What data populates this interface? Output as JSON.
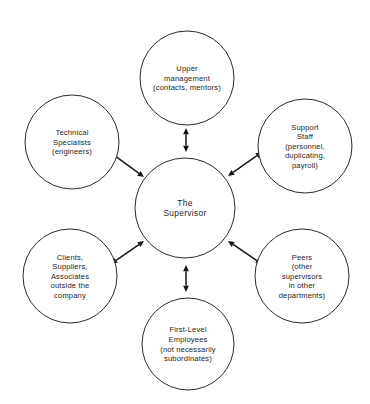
{
  "diagram": {
    "type": "hub-and-spoke",
    "colors": {
      "background": "#ffffff",
      "circle_stroke": "#2b2b2b",
      "text": "#1d1d1d",
      "arrow": "#161616"
    },
    "center": {
      "id": "the-supervisor",
      "lines": [
        "The",
        "Supervisor"
      ],
      "cx": 185,
      "cy": 208,
      "r": 50
    },
    "nodes": [
      {
        "id": "upper-management",
        "position": "top",
        "lines": [
          "Upper",
          "management",
          "(contacts,  mentors)"
        ],
        "cx": 187,
        "cy": 78,
        "r": 47
      },
      {
        "id": "support-staff",
        "position": "top-right",
        "lines": [
          "Support",
          "Staff",
          "(personnel,",
          "duplicating,",
          "payroll)"
        ],
        "cx": 305,
        "cy": 146,
        "r": 47
      },
      {
        "id": "peers",
        "position": "bottom-right",
        "lines": [
          "Peers",
          "(other",
          "supervisors",
          "in other",
          "departments)"
        ],
        "cx": 302,
        "cy": 276,
        "r": 47
      },
      {
        "id": "first-level-employees",
        "position": "bottom",
        "lines": [
          "First-Level",
          "Employees",
          "(not necessarily",
          "subordinates)"
        ],
        "cx": 188,
        "cy": 344,
        "r": 46
      },
      {
        "id": "clients-suppliers-associates",
        "position": "bottom-left",
        "lines": [
          "Clients,",
          "Suppliers,",
          "Associates",
          "outside the",
          "company"
        ],
        "cx": 70,
        "cy": 276,
        "r": 47
      },
      {
        "id": "technical-specialists",
        "position": "top-left",
        "lines": [
          "Technical",
          "Specialists",
          "(engineers)"
        ],
        "cx": 72,
        "cy": 142,
        "r": 47
      }
    ],
    "connectors": [
      {
        "id": "supervisor-upper-management",
        "from": "the-supervisor",
        "to": "upper-management",
        "style": "double-arrow",
        "x1": 186,
        "y1": 152,
        "x2": 186,
        "y2": 128
      },
      {
        "id": "supervisor-support-staff",
        "from": "the-supervisor",
        "to": "support-staff",
        "style": "double-arrow",
        "x1": 228,
        "y1": 176,
        "x2": 262,
        "y2": 152
      },
      {
        "id": "supervisor-peers",
        "from": "the-supervisor",
        "to": "peers",
        "style": "double-arrow",
        "x1": 228,
        "y1": 241,
        "x2": 262,
        "y2": 264
      },
      {
        "id": "supervisor-first-level-employees",
        "from": "the-supervisor",
        "to": "first-level-employees",
        "style": "double-arrow",
        "x1": 186,
        "y1": 265,
        "x2": 186,
        "y2": 292
      },
      {
        "id": "supervisor-clients-suppliers-associates",
        "from": "the-supervisor",
        "to": "clients-suppliers-associates",
        "style": "double-arrow",
        "x1": 144,
        "y1": 241,
        "x2": 111,
        "y2": 264
      },
      {
        "id": "supervisor-technical-specialists",
        "from": "the-supervisor",
        "to": "technical-specialists",
        "style": "double-arrow",
        "x1": 144,
        "y1": 177,
        "x2": 111,
        "y2": 153
      }
    ]
  }
}
